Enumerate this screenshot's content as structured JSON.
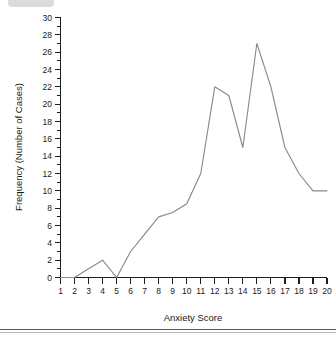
{
  "chart_data": {
    "type": "line",
    "title": "",
    "subtitle": "",
    "xlabel": "Anxiety Score",
    "ylabel": "Frequency (Number of Cases)",
    "x": [
      1,
      2,
      3,
      4,
      5,
      6,
      7,
      8,
      9,
      10,
      11,
      12,
      13,
      14,
      15,
      16,
      17,
      18,
      19,
      20
    ],
    "values": [
      0,
      0,
      1,
      2,
      0,
      3,
      5,
      7,
      7.5,
      8.5,
      12,
      22,
      21,
      15,
      27,
      22,
      15,
      12,
      10,
      10
    ],
    "series": [
      {
        "name": "Frequency",
        "values": [
          0,
          0,
          1,
          2,
          0,
          3,
          5,
          7,
          7.5,
          8.5,
          12,
          22,
          21,
          15,
          27,
          22,
          15,
          12,
          10,
          10
        ],
        "color": "#8a8a8a"
      }
    ],
    "xlim": [
      1,
      20
    ],
    "ylim": [
      0,
      30
    ],
    "xticks": [
      "1",
      "2",
      "3",
      "4",
      "5",
      "6",
      "7",
      "8",
      "9",
      "10",
      "11",
      "12",
      "13",
      "14",
      "15",
      "16",
      "17",
      "18",
      "19",
      "20"
    ],
    "yticks": [
      "0",
      "2",
      "4",
      "6",
      "8",
      "10",
      "12",
      "14",
      "16",
      "18",
      "20",
      "22",
      "24",
      "26",
      "28",
      "30"
    ],
    "ytick_values": [
      0,
      2,
      4,
      6,
      8,
      10,
      12,
      14,
      16,
      18,
      20,
      22,
      24,
      26,
      28,
      30
    ],
    "y_minor_step": 1,
    "grid": false,
    "legend": false,
    "legend_position": "none",
    "annotations": []
  },
  "figure": {
    "background_color": "#ffffff",
    "axis_color": "#1d1d1d",
    "line_color": "#8a8a8a"
  }
}
